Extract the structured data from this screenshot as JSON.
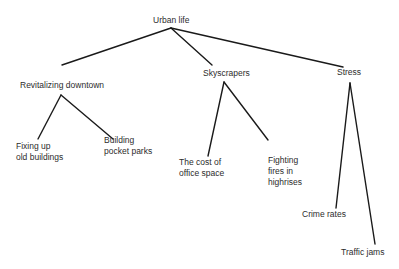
{
  "diagram": {
    "type": "tree",
    "root": {
      "label": "Urban life",
      "children": [
        {
          "label": "Revitalizing downtown",
          "children": [
            {
              "label": "Fixing up\nold buildings"
            },
            {
              "label": "Building\npocket parks"
            }
          ]
        },
        {
          "label": "Skyscrapers",
          "children": [
            {
              "label": "The cost of\noffice space"
            },
            {
              "label": "Fighting\nfires in\nhighrises"
            }
          ]
        },
        {
          "label": "Stress",
          "children": [
            {
              "label": "Crime rates"
            },
            {
              "label": "Traffic jams"
            }
          ]
        }
      ]
    },
    "colors": {
      "line": "#1a1a1a",
      "text": "#2c2c2c",
      "background": "#ffffff"
    }
  }
}
